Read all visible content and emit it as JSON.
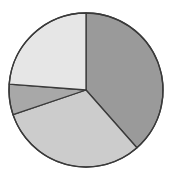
{
  "chart_data": {
    "type": "pie",
    "title": "",
    "title_note": "title text cut off at top edge, illegible",
    "start_angle_deg": 0,
    "direction": "clockwise",
    "labels": [
      "",
      "",
      "",
      ""
    ],
    "values": [
      38.5,
      31.3,
      6.4,
      23.8
    ],
    "colors": [
      "#9a9a9a",
      "#cccccc",
      "#a8a8a8",
      "#e6e6e6"
    ],
    "outline_color": "#3a3a3a",
    "legend": false,
    "center": [
      86,
      90
    ],
    "radius": 77
  }
}
